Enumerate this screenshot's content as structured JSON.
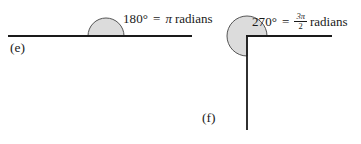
{
  "figure": {
    "background_color": "#ffffff",
    "stroke_color": "#1a1a1a",
    "fill_color": "#dcdcdc",
    "parts": [
      {
        "id": "e",
        "part_label": "(e)",
        "angle_degrees": "180°",
        "equals": "=",
        "radian_symbol": "π",
        "radian_word": "radians",
        "full_label": "180° = π radians",
        "shape": "semicircle-above-straight-line",
        "arc_sweep_degrees": 180
      },
      {
        "id": "f",
        "part_label": "(f)",
        "angle_degrees": "270°",
        "equals": "=",
        "radian_numerator": "3π",
        "radian_denominator": "2",
        "radian_word": "radians",
        "full_label": "270° = 3π/2 radians",
        "shape": "three-quarter-circle-at-right-angle",
        "arc_sweep_degrees": 270
      }
    ]
  },
  "geometry": {
    "part_e": {
      "baseline_y": 36,
      "baseline_x_start": 8,
      "baseline_x_end": 192,
      "circle_center_x": 106,
      "circle_center_y": 36,
      "radius": 18
    },
    "part_f": {
      "vertex_x": 247,
      "vertex_y": 36,
      "ray_horizontal_x_end": 332,
      "ray_vertical_y_end": 130,
      "circle_center_x": 247,
      "circle_center_y": 36,
      "radius": 20
    }
  }
}
